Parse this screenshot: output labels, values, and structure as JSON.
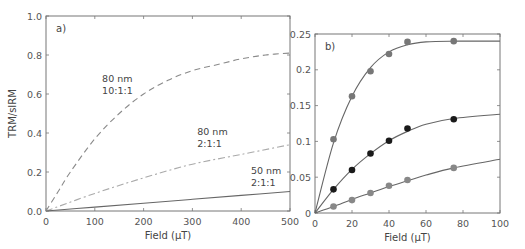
{
  "chart_data": [
    {
      "type": "line",
      "panel_label": "a)",
      "xlabel": "Field (μT)",
      "ylabel": "TRM/sIRM",
      "xlim": [
        0,
        500
      ],
      "ylim": [
        0,
        1.0
      ],
      "xticks": [
        "0",
        "100",
        "200",
        "300",
        "400",
        "500"
      ],
      "yticks": [
        "0.0",
        "0.2",
        "0.4",
        "0.6",
        "0.8",
        "1.0"
      ],
      "grid": false,
      "series": [
        {
          "name": "80 nm 10:1:1",
          "style": "dashed",
          "color": "#8a8a8a",
          "x": [
            0,
            25,
            50,
            100,
            150,
            200,
            250,
            300,
            350,
            400,
            450,
            500
          ],
          "y": [
            0,
            0.1,
            0.2,
            0.37,
            0.5,
            0.6,
            0.67,
            0.72,
            0.75,
            0.78,
            0.8,
            0.81
          ]
        },
        {
          "name": "80 nm 2:1:1",
          "style": "dashdot",
          "color": "#aaaaaa",
          "x": [
            0,
            100,
            200,
            300,
            400,
            500
          ],
          "y": [
            0,
            0.09,
            0.17,
            0.24,
            0.29,
            0.34
          ]
        },
        {
          "name": "50 nm 2:1:1",
          "style": "solid",
          "color": "#666666",
          "x": [
            0,
            100,
            200,
            300,
            400,
            500
          ],
          "y": [
            0,
            0.02,
            0.04,
            0.06,
            0.08,
            0.1
          ]
        }
      ],
      "annotations": [
        {
          "lines": [
            "80 nm",
            "10:1:1"
          ],
          "x": 115,
          "y": 0.66
        },
        {
          "lines": [
            "80 nm",
            "2:1:1"
          ],
          "x": 310,
          "y": 0.39
        },
        {
          "lines": [
            "50 nm",
            "2:1:1"
          ],
          "x": 420,
          "y": 0.19
        }
      ]
    },
    {
      "type": "scatter",
      "panel_label": "b)",
      "xlabel": "Field (μT)",
      "ylabel": "",
      "xlim": [
        0,
        100
      ],
      "ylim": [
        0,
        0.25
      ],
      "xticks": [
        "0",
        "20",
        "40",
        "60",
        "80",
        "100"
      ],
      "yticks": [
        "0",
        "0.05",
        "0.1",
        "0.15",
        "0.2",
        "0.25"
      ],
      "grid": false,
      "series": [
        {
          "name": "top",
          "marker_color": "#777777",
          "x": [
            10,
            20,
            30,
            40,
            50,
            75
          ],
          "y": [
            0.103,
            0.163,
            0.198,
            0.222,
            0.239,
            0.24
          ],
          "fit_x": [
            0,
            10,
            20,
            30,
            40,
            50,
            60,
            75,
            100
          ],
          "fit_y": [
            0,
            0.098,
            0.163,
            0.203,
            0.225,
            0.235,
            0.239,
            0.24,
            0.24
          ]
        },
        {
          "name": "middle",
          "marker_color": "#1a1a1a",
          "x": [
            10,
            20,
            30,
            40,
            50,
            75
          ],
          "y": [
            0.033,
            0.06,
            0.083,
            0.101,
            0.118,
            0.131
          ],
          "fit_x": [
            0,
            10,
            20,
            30,
            40,
            50,
            60,
            75,
            100
          ],
          "fit_y": [
            0,
            0.033,
            0.061,
            0.083,
            0.101,
            0.114,
            0.124,
            0.132,
            0.138
          ]
        },
        {
          "name": "bottom",
          "marker_color": "#888888",
          "x": [
            10,
            20,
            30,
            40,
            50,
            75
          ],
          "y": [
            0.009,
            0.018,
            0.028,
            0.038,
            0.046,
            0.063
          ],
          "fit_x": [
            0,
            10,
            20,
            30,
            40,
            50,
            60,
            75,
            100
          ],
          "fit_y": [
            0,
            0.009,
            0.019,
            0.028,
            0.037,
            0.045,
            0.053,
            0.063,
            0.075
          ]
        }
      ]
    }
  ]
}
